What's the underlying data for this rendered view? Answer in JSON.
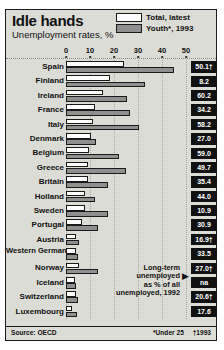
{
  "title": "Idle hands",
  "subtitle": "Unemployment rates, %",
  "legend": {
    "total": "Total, latest",
    "youth": "Youth*, 1993"
  },
  "axis": {
    "ticks": [
      "0",
      "10",
      "20",
      "30",
      "40",
      "50"
    ]
  },
  "annotation": {
    "line1": "Long-term",
    "line2": "unemployed",
    "line3": "as % of all",
    "line4": "unemployed, 1992",
    "arrow": "▶"
  },
  "footer": {
    "source": "Source: OECD",
    "note1": "*Under 25",
    "note2": "†1993"
  },
  "colors": {
    "background": "#dcdcd6",
    "frame": "#1a1a1a",
    "total_bar": "#ffffff",
    "youth_bar": "#8f8f8f",
    "value_box": "#111111",
    "value_text": "#ffffff"
  },
  "chart_data": {
    "type": "bar",
    "title": "Idle hands",
    "subtitle": "Unemployment rates, %",
    "xlabel": "",
    "ylabel": "",
    "xlim": [
      0,
      50
    ],
    "grid": true,
    "legend_position": "top-right",
    "orientation": "horizontal",
    "categories": [
      "Spain",
      "Finland",
      "Ireland",
      "France",
      "Italy",
      "Denmark",
      "Belgium",
      "Greece",
      "Britain",
      "Holland",
      "Sweden",
      "Portugal",
      "Austria",
      "Western Germany",
      "Norway",
      "Iceland",
      "Switzerland",
      "Luxembourg"
    ],
    "series": [
      {
        "name": "Total, latest",
        "values": [
          24.0,
          18.5,
          15.5,
          12.2,
          11.3,
          10.3,
          9.5,
          9.0,
          9.0,
          8.0,
          7.8,
          6.8,
          4.3,
          4.0,
          5.5,
          3.6,
          4.3,
          2.6
        ]
      },
      {
        "name": "Youth*, 1993",
        "values": [
          45.0,
          33.0,
          25.5,
          26.5,
          30.5,
          12.5,
          22.0,
          25.0,
          17.5,
          12.0,
          17.5,
          13.5,
          5.5,
          5.0,
          13.5,
          4.0,
          5.0,
          4.5
        ]
      }
    ],
    "annotation_series": {
      "name": "Long-term unemployed as % of all unemployed, 1992",
      "values": [
        "50.1†",
        "8.2",
        "60.2",
        "34.2",
        "58.2",
        "27.0",
        "59.0",
        "49.7",
        "35.4",
        "44.0",
        "10.9",
        "30.9",
        "16.9†",
        "33.5",
        "27.0†",
        "na",
        "20.6†",
        "17.6"
      ]
    }
  },
  "rows": [
    {
      "name": "Spain",
      "total": 24.0,
      "youth": 45.0,
      "value": "50.1†",
      "twoline": false
    },
    {
      "name": "Finland",
      "total": 18.5,
      "youth": 33.0,
      "value": "8.2",
      "twoline": false
    },
    {
      "name": "Ireland",
      "total": 15.5,
      "youth": 25.5,
      "value": "60.2",
      "twoline": false
    },
    {
      "name": "France",
      "total": 12.2,
      "youth": 26.5,
      "value": "34.2",
      "twoline": false
    },
    {
      "name": "Italy",
      "total": 11.3,
      "youth": 30.5,
      "value": "58.2",
      "twoline": false
    },
    {
      "name": "Denmark",
      "total": 10.3,
      "youth": 12.5,
      "value": "27.0",
      "twoline": false
    },
    {
      "name": "Belgium",
      "total": 9.5,
      "youth": 22.0,
      "value": "59.0",
      "twoline": false
    },
    {
      "name": "Greece",
      "total": 9.0,
      "youth": 25.0,
      "value": "49.7",
      "twoline": false
    },
    {
      "name": "Britain",
      "total": 9.0,
      "youth": 17.5,
      "value": "35.4",
      "twoline": false
    },
    {
      "name": "Holland",
      "total": 8.0,
      "youth": 12.0,
      "value": "44.0",
      "twoline": false
    },
    {
      "name": "Sweden",
      "total": 7.8,
      "youth": 17.5,
      "value": "10.9",
      "twoline": false
    },
    {
      "name": "Portugal",
      "total": 6.8,
      "youth": 13.5,
      "value": "30.9",
      "twoline": false
    },
    {
      "name": "Austria",
      "total": 4.3,
      "youth": 5.5,
      "value": "16.9†",
      "twoline": false
    },
    {
      "name": "Western Germany",
      "total": 4.0,
      "youth": 5.0,
      "value": "33.5",
      "twoline": true
    },
    {
      "name": "Norway",
      "total": 5.5,
      "youth": 13.5,
      "value": "27.0†",
      "twoline": false
    },
    {
      "name": "Iceland",
      "total": 3.6,
      "youth": 4.0,
      "value": "na",
      "twoline": false
    },
    {
      "name": "Switzerland",
      "total": 4.3,
      "youth": 5.0,
      "value": "20.6†",
      "twoline": false
    },
    {
      "name": "Luxembourg",
      "total": 2.6,
      "youth": 4.5,
      "value": "17.6",
      "twoline": false
    }
  ]
}
